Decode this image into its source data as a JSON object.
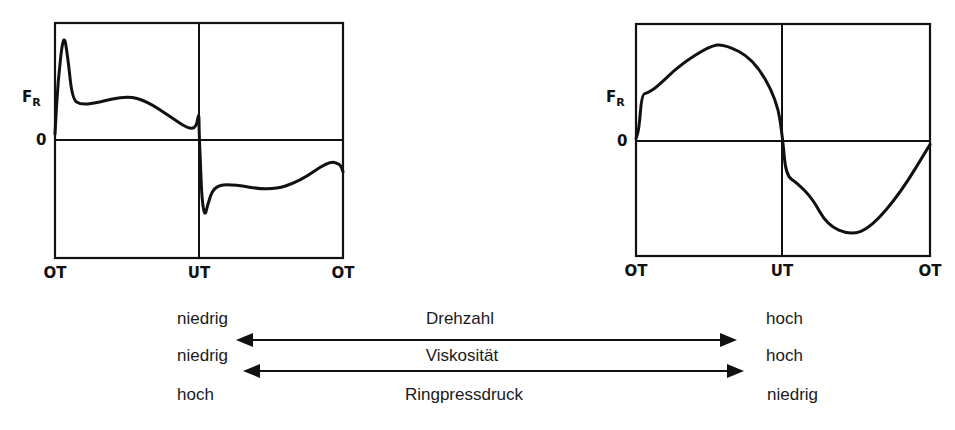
{
  "charts": [
    {
      "name": "left",
      "y_label": "F",
      "y_label_sub": "R",
      "zero_label": "0",
      "x_ticks": [
        "OT",
        "UT",
        "OT"
      ],
      "curve": [
        [
          0,
          0.05
        ],
        [
          0.01,
          0.5
        ],
        [
          0.03,
          0.93
        ],
        [
          0.045,
          0.7
        ],
        [
          0.06,
          0.35
        ],
        [
          0.09,
          0.3
        ],
        [
          0.15,
          0.32
        ],
        [
          0.25,
          0.38
        ],
        [
          0.32,
          0.33
        ],
        [
          0.4,
          0.2
        ],
        [
          0.46,
          0.1
        ],
        [
          0.49,
          0.1
        ],
        [
          0.5,
          0.25
        ],
        [
          0.5,
          0.1
        ],
        [
          0.505,
          -0.2
        ],
        [
          0.51,
          -0.5
        ],
        [
          0.52,
          -0.65
        ],
        [
          0.53,
          -0.55
        ],
        [
          0.55,
          -0.4
        ],
        [
          0.6,
          -0.37
        ],
        [
          0.75,
          -0.43
        ],
        [
          0.85,
          -0.35
        ],
        [
          0.95,
          -0.18
        ],
        [
          0.99,
          -0.2
        ],
        [
          1.0,
          -0.27
        ]
      ]
    },
    {
      "name": "right",
      "y_label": "F",
      "y_label_sub": "R",
      "zero_label": "0",
      "x_ticks": [
        "OT",
        "UT",
        "OT"
      ],
      "curve": [
        [
          0,
          0.02
        ],
        [
          0.01,
          0.1
        ],
        [
          0.02,
          0.4
        ],
        [
          0.04,
          0.41
        ],
        [
          0.07,
          0.46
        ],
        [
          0.15,
          0.65
        ],
        [
          0.25,
          0.81
        ],
        [
          0.3,
          0.83
        ],
        [
          0.4,
          0.7
        ],
        [
          0.48,
          0.35
        ],
        [
          0.5,
          0.0
        ],
        [
          0.51,
          -0.3
        ],
        [
          0.55,
          -0.37
        ],
        [
          0.6,
          -0.5
        ],
        [
          0.65,
          -0.73
        ],
        [
          0.73,
          -0.82
        ],
        [
          0.8,
          -0.75
        ],
        [
          0.9,
          -0.45
        ],
        [
          1.0,
          -0.03
        ]
      ]
    }
  ],
  "relations": [
    {
      "left": "niedrig",
      "label": "Drehzahl",
      "right": "hoch"
    },
    {
      "left": "niedrig",
      "label": "Viskosität",
      "right": "hoch"
    },
    {
      "left": "hoch",
      "label": "Ringpressdruck",
      "right": "niedrig"
    }
  ]
}
